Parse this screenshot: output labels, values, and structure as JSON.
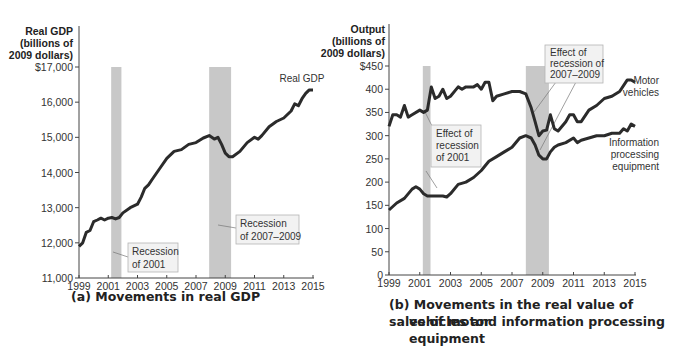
{
  "chart_data": [
    {
      "type": "line",
      "panel": "a",
      "title": "(a) Movements in real GDP",
      "ylabel": [
        "Real GDP",
        "(billions of",
        "2009 dollars)"
      ],
      "xlabel": "",
      "xlim": [
        1999,
        2015
      ],
      "ylim": [
        11000,
        17000
      ],
      "x_ticks": [
        "1999",
        "2001",
        "2003",
        "2005",
        "2007",
        "2009",
        "2011",
        "2013",
        "2015"
      ],
      "y_ticks": [
        "11,000",
        "12,000",
        "13,000",
        "14,000",
        "15,000",
        "16,000",
        "$17,000"
      ],
      "grid": false,
      "recessions": [
        {
          "start": 2001.2,
          "end": 2001.9,
          "label": "Recession of 2001"
        },
        {
          "start": 2007.9,
          "end": 2009.4,
          "label": "Recession of 2007–2009"
        }
      ],
      "series": [
        {
          "name": "Real GDP",
          "x": [
            1999.0,
            1999.25,
            1999.5,
            1999.75,
            2000.0,
            2000.25,
            2000.5,
            2000.75,
            2001.0,
            2001.25,
            2001.5,
            2001.75,
            2002.0,
            2002.5,
            2003.0,
            2003.25,
            2003.5,
            2003.75,
            2004.0,
            2004.5,
            2005.0,
            2005.5,
            2006.0,
            2006.5,
            2007.0,
            2007.5,
            2007.9,
            2008.25,
            2008.5,
            2008.75,
            2009.0,
            2009.25,
            2009.5,
            2010.0,
            2010.5,
            2011.0,
            2011.25,
            2011.5,
            2012.0,
            2012.5,
            2013.0,
            2013.5,
            2013.75,
            2014.0,
            2014.25,
            2014.5,
            2014.75,
            2015.0
          ],
          "values": [
            11900,
            12000,
            12300,
            12350,
            12600,
            12650,
            12700,
            12650,
            12700,
            12720,
            12680,
            12720,
            12850,
            13000,
            13100,
            13300,
            13550,
            13650,
            13800,
            14100,
            14400,
            14600,
            14650,
            14800,
            14850,
            14980,
            15050,
            14950,
            15000,
            14800,
            14550,
            14450,
            14450,
            14600,
            14850,
            15000,
            14950,
            15050,
            15300,
            15450,
            15550,
            15750,
            15950,
            15900,
            16100,
            16250,
            16350,
            16350
          ]
        }
      ],
      "annotations": [
        "Real GDP",
        "Recession of 2001",
        "Recession of 2007–2009"
      ]
    },
    {
      "type": "line",
      "panel": "b",
      "title": "(b) Movements in the real value of sales of motor vehicles and information processing equipment",
      "ylabel": [
        "Output",
        "(billions of",
        "2009 dollars)"
      ],
      "xlabel": "",
      "xlim": [
        1999,
        2015
      ],
      "ylim": [
        0,
        450
      ],
      "x_ticks": [
        "1999",
        "2001",
        "2003",
        "2005",
        "2007",
        "2009",
        "2011",
        "2013",
        "2015"
      ],
      "y_ticks": [
        "0",
        "50",
        "100",
        "150",
        "200",
        "250",
        "300",
        "350",
        "400",
        "$450"
      ],
      "grid": false,
      "recessions": [
        {
          "start": 2001.2,
          "end": 2001.7
        },
        {
          "start": 2007.9,
          "end": 2009.4
        }
      ],
      "series": [
        {
          "name": "Motor vehicles",
          "x": [
            1999.0,
            1999.25,
            1999.5,
            1999.75,
            2000.0,
            2000.25,
            2000.5,
            2001.0,
            2001.25,
            2001.5,
            2001.75,
            2002.0,
            2002.25,
            2002.5,
            2002.75,
            2003.0,
            2003.5,
            2003.75,
            2004.0,
            2004.5,
            2004.75,
            2005.0,
            2005.25,
            2005.5,
            2005.75,
            2006.0,
            2006.5,
            2007.0,
            2007.5,
            2007.9,
            2008.25,
            2008.5,
            2008.75,
            2009.0,
            2009.25,
            2009.5,
            2009.75,
            2010.0,
            2010.5,
            2010.75,
            2011.0,
            2011.25,
            2011.5,
            2012.0,
            2012.5,
            2013.0,
            2013.5,
            2014.0,
            2014.5,
            2014.75,
            2015.0
          ],
          "values": [
            320,
            345,
            345,
            340,
            365,
            340,
            345,
            355,
            350,
            355,
            405,
            380,
            385,
            400,
            380,
            385,
            405,
            400,
            405,
            405,
            410,
            400,
            415,
            415,
            375,
            385,
            390,
            395,
            395,
            390,
            360,
            330,
            300,
            310,
            312,
            345,
            315,
            310,
            330,
            345,
            345,
            330,
            330,
            355,
            365,
            380,
            385,
            395,
            420,
            420,
            415
          ]
        },
        {
          "name": "Information processing equipment",
          "x": [
            1999.0,
            1999.5,
            2000.0,
            2000.5,
            2000.75,
            2001.0,
            2001.25,
            2001.5,
            2002.0,
            2002.5,
            2002.75,
            2003.0,
            2003.5,
            2004.0,
            2004.5,
            2005.0,
            2005.5,
            2006.0,
            2006.5,
            2007.0,
            2007.5,
            2007.9,
            2008.25,
            2008.5,
            2008.75,
            2009.0,
            2009.25,
            2009.5,
            2009.75,
            2010.0,
            2010.5,
            2011.0,
            2011.25,
            2011.5,
            2012.0,
            2012.5,
            2013.0,
            2013.5,
            2014.0,
            2014.25,
            2014.5,
            2014.75,
            2015.0
          ],
          "values": [
            140,
            155,
            165,
            185,
            190,
            185,
            175,
            170,
            170,
            170,
            168,
            175,
            195,
            200,
            210,
            225,
            245,
            255,
            265,
            275,
            295,
            300,
            295,
            280,
            258,
            250,
            250,
            265,
            275,
            280,
            285,
            295,
            285,
            290,
            295,
            300,
            300,
            305,
            305,
            315,
            310,
            325,
            320
          ]
        }
      ],
      "annotations": [
        "Motor vehicles",
        "Information processing equipment",
        "Effect of recession of 2001",
        "Effect of recession of 2007–2009"
      ]
    }
  ],
  "panel_a": {
    "ylabel": [
      "Real GDP",
      "(billions of",
      "2009 dollars)"
    ],
    "y_ticks": [
      "$17,000",
      "16,000",
      "15,000",
      "14,000",
      "13,000",
      "12,000",
      "11,000"
    ],
    "x_ticks": [
      "1999",
      "2001",
      "2003",
      "2005",
      "2007",
      "2009",
      "2011",
      "2013",
      "2015"
    ],
    "series_label": "Real GDP",
    "note_2001": [
      "Recession",
      "of 2001"
    ],
    "note_2008": [
      "Recession",
      "of 2007–2009"
    ],
    "caption": "(a) Movements in real GDP"
  },
  "panel_b": {
    "ylabel": [
      "Output",
      "(billions of",
      "2009 dollars)"
    ],
    "y_ticks": [
      "$450",
      "400",
      "350",
      "300",
      "250",
      "200",
      "150",
      "100",
      "50",
      "0"
    ],
    "x_ticks": [
      "1999",
      "2001",
      "2003",
      "2005",
      "2007",
      "2009",
      "2011",
      "2013",
      "2015"
    ],
    "motor_label": [
      "Motor",
      "vehicles"
    ],
    "info_label": [
      "Information",
      "processing",
      "equipment"
    ],
    "note_2001": [
      "Effect of",
      "recession",
      "of 2001"
    ],
    "note_2008": [
      "Effect of",
      "recession of",
      "2007–2009"
    ],
    "caption_line1": "(b) Movements in the real value of sales of motor",
    "caption_line2": "vehicles and information processing equipment"
  },
  "colors": {
    "line": "#2b2b2b",
    "recession_band": "#c8c8c8",
    "note_box_fill": "#f2f2f2",
    "note_box_border": "#b5b5b5",
    "axis": "#444444"
  }
}
